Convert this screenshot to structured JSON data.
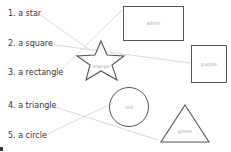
{
  "worksheet": {
    "items": [
      {
        "label": "1. a star"
      },
      {
        "label": "2. a square"
      },
      {
        "label": "3. a rectangle"
      },
      {
        "label": "4. a triangle"
      },
      {
        "label": "5. a circle"
      }
    ],
    "shapes": [
      {
        "type": "rectangle",
        "color_label": "white"
      },
      {
        "type": "square",
        "color_label": "purple"
      },
      {
        "type": "star",
        "color_label": "orange"
      },
      {
        "type": "circle",
        "color_label": "red"
      },
      {
        "type": "triangle",
        "color_label": "green"
      }
    ],
    "connectors": [
      {
        "from": "1. a star",
        "to": "star"
      },
      {
        "from": "2. a square",
        "to": "square"
      },
      {
        "from": "3. a rectangle",
        "to": "rectangle"
      },
      {
        "from": "4. a triangle",
        "to": "triangle"
      },
      {
        "from": "5. a circle",
        "to": "circle"
      }
    ],
    "colors": {
      "text": "#333333",
      "outline": "#555555",
      "connector": "#cccccc",
      "shape_label": "#aaaaaa"
    }
  }
}
